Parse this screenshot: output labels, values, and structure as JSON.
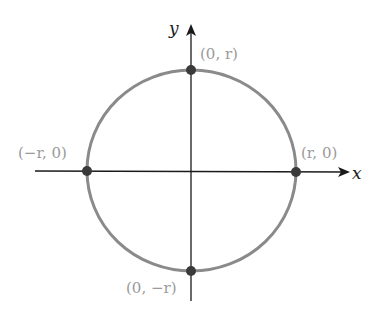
{
  "diagram": {
    "type": "circle-on-axes",
    "axes": {
      "x_label": "x",
      "y_label": "y"
    },
    "circle": {
      "stroke_color": "#8a8a8a"
    },
    "points": [
      {
        "name": "top",
        "label": "(0, r)"
      },
      {
        "name": "left",
        "label": "(−r, 0)"
      },
      {
        "name": "right",
        "label": "(r, 0)"
      },
      {
        "name": "bottom",
        "label": "(0, −r)"
      }
    ],
    "colors": {
      "axis": "#1a1a1a",
      "point": "#3a3a3a",
      "label": "#9a9a9a"
    }
  }
}
